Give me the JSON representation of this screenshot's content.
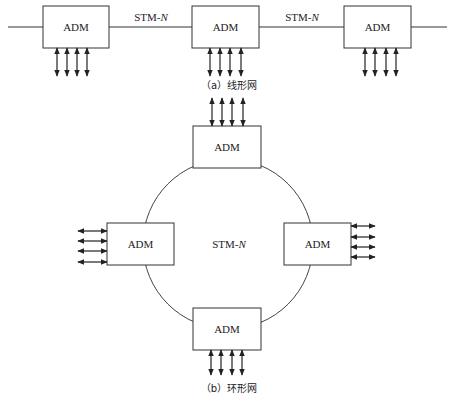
{
  "diagram": {
    "linear": {
      "caption": "（a）线形网",
      "link_label": "STM-N",
      "link_label_prefix": "STM-",
      "link_label_italic": "N",
      "nodes": [
        {
          "label": "ADM",
          "x": 43,
          "y": 6,
          "w": 66,
          "h": 42,
          "tributaries": [
            57,
            67,
            77,
            87
          ]
        },
        {
          "label": "ADM",
          "x": 192,
          "y": 6,
          "w": 67,
          "h": 42,
          "tributaries": [
            210,
            220,
            230,
            241
          ]
        },
        {
          "label": "ADM",
          "x": 344,
          "y": 6,
          "w": 67,
          "h": 42,
          "tributaries": [
            365,
            375,
            386,
            396
          ]
        }
      ],
      "link_labels": [
        {
          "text_prefix": "STM-",
          "text_italic": "N",
          "x": 151,
          "y": 21
        },
        {
          "text_prefix": "STM-",
          "text_italic": "N",
          "x": 302,
          "y": 21
        }
      ]
    },
    "ring": {
      "caption": "（b）环形网",
      "center_label_prefix": "STM-",
      "center_label_italic": "N",
      "circle": {
        "cx": 228,
        "cy": 244,
        "r": 85
      },
      "nodes": [
        {
          "position": "top",
          "label": "ADM",
          "x": 193,
          "y": 126,
          "w": 68,
          "h": 42
        },
        {
          "position": "left",
          "label": "ADM",
          "x": 107,
          "y": 223,
          "w": 67,
          "h": 42
        },
        {
          "position": "right",
          "label": "ADM",
          "x": 284,
          "y": 223,
          "w": 67,
          "h": 42
        },
        {
          "position": "bottom",
          "label": "ADM",
          "x": 193,
          "y": 308,
          "w": 68,
          "h": 42
        }
      ]
    },
    "footer_ghost_text": ""
  }
}
